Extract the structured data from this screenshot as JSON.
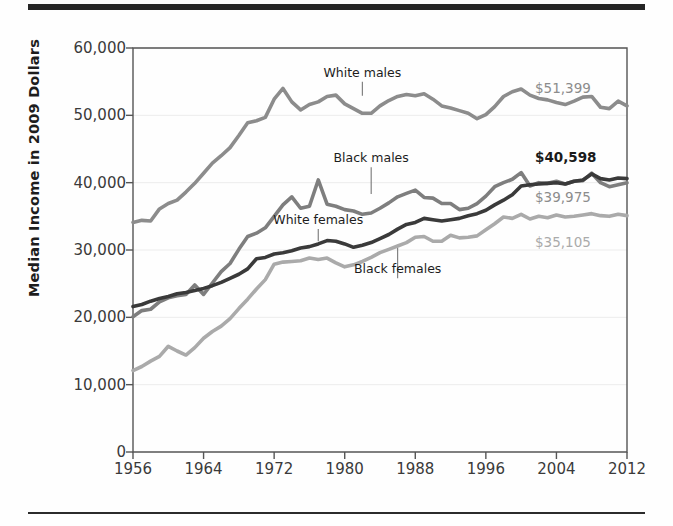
{
  "figure": {
    "rule_top": "horizontal-rule",
    "rule_bottom": "horizontal-rule"
  },
  "chart_data": {
    "type": "line",
    "title": "",
    "xlabel": "",
    "ylabel": "Median Income in 2009 Dollars",
    "xlim": [
      1956,
      2012
    ],
    "ylim": [
      0,
      60000
    ],
    "grid": true,
    "legend_position": "inline-annotations",
    "ytick_labels": [
      "0",
      "10,000",
      "20,000",
      "30,000",
      "40,000",
      "50,000",
      "60,000"
    ],
    "ytick_values": [
      0,
      10000,
      20000,
      30000,
      40000,
      50000,
      60000
    ],
    "xtick_labels": [
      "1956",
      "1964",
      "1972",
      "1980",
      "1988",
      "1996",
      "2004",
      "2012"
    ],
    "xtick_values": [
      1956,
      1964,
      1972,
      1980,
      1988,
      1996,
      2004,
      2012
    ],
    "x": [
      1956,
      1957,
      1958,
      1959,
      1960,
      1961,
      1962,
      1963,
      1964,
      1965,
      1966,
      1967,
      1968,
      1969,
      1970,
      1971,
      1972,
      1973,
      1974,
      1975,
      1976,
      1977,
      1978,
      1979,
      1980,
      1981,
      1982,
      1983,
      1984,
      1985,
      1986,
      1987,
      1988,
      1989,
      1990,
      1991,
      1992,
      1993,
      1994,
      1995,
      1996,
      1997,
      1998,
      1999,
      2000,
      2001,
      2002,
      2003,
      2004,
      2005,
      2006,
      2007,
      2008,
      2009,
      2010,
      2011,
      2012
    ],
    "series": [
      {
        "name": "White males",
        "color": "#8c8c8c",
        "end_value": 51399,
        "end_label": "$51,399",
        "end_label_color": "#8c8c8c",
        "end_label_bold": false,
        "annotation": {
          "text": "White males",
          "x": 1982,
          "y_text": 55600,
          "y_line_end": 52900
        },
        "values": [
          34100,
          34400,
          34300,
          36100,
          36900,
          37400,
          38600,
          39900,
          41400,
          42900,
          44000,
          45200,
          47000,
          48900,
          49200,
          49700,
          52400,
          54000,
          52000,
          50800,
          51600,
          52000,
          52800,
          53000,
          51700,
          51000,
          50300,
          50300,
          51400,
          52200,
          52800,
          53100,
          52900,
          53200,
          52400,
          51400,
          51100,
          50700,
          50300,
          49500,
          50100,
          51300,
          52800,
          53500,
          53900,
          53000,
          52500,
          52300,
          51900,
          51600,
          52100,
          52700,
          52800,
          51200,
          51000,
          52100,
          51399
        ]
      },
      {
        "name": "Black males",
        "color": "#7e7e7e",
        "end_value": 39975,
        "end_label": "$39,975",
        "end_label_color": "#8c8c8c",
        "end_label_bold": false,
        "annotation": {
          "text": "Black males",
          "x": 1983,
          "y_text": 42900,
          "y_line_end": 38300
        },
        "values": [
          20100,
          21000,
          21200,
          22300,
          22900,
          23200,
          23400,
          24800,
          23400,
          25100,
          26800,
          28000,
          30100,
          32000,
          32500,
          33300,
          35000,
          36700,
          37900,
          36200,
          36500,
          40400,
          36800,
          36500,
          36000,
          35800,
          35300,
          35500,
          36200,
          37000,
          37900,
          38400,
          38900,
          37800,
          37700,
          36900,
          36900,
          36000,
          36200,
          36900,
          38000,
          39400,
          40000,
          40500,
          41500,
          39500,
          40000,
          39900,
          40200,
          39800,
          40200,
          40300,
          41400,
          40000,
          39400,
          39700,
          39975
        ]
      },
      {
        "name": "White females",
        "color": "#3a3a3a",
        "end_value": 40598,
        "end_label": "$40,598",
        "end_label_color": "#1a1a1a",
        "end_label_bold": true,
        "annotation": {
          "text": "White females",
          "x": 1977,
          "y_text": 33700,
          "y_line_end": 31300
        },
        "values": [
          21600,
          21900,
          22400,
          22800,
          23100,
          23500,
          23700,
          24000,
          24300,
          24700,
          25200,
          25800,
          26400,
          27200,
          28700,
          28900,
          29400,
          29600,
          29900,
          30300,
          30500,
          30900,
          31400,
          31300,
          30900,
          30400,
          30700,
          31100,
          31700,
          32300,
          33100,
          33800,
          34100,
          34700,
          34500,
          34300,
          34500,
          34700,
          35100,
          35400,
          35900,
          36700,
          37400,
          38200,
          39500,
          39700,
          39800,
          39900,
          40000,
          39800,
          40200,
          40400,
          41300,
          40600,
          40400,
          40700,
          40598
        ]
      },
      {
        "name": "Black females",
        "color": "#aaaaaa",
        "end_value": 35105,
        "end_label": "$35,105",
        "end_label_color": "#aaaaaa",
        "end_label_bold": false,
        "annotation": {
          "text": "Black females",
          "x": 1986,
          "y_text": 26400,
          "y_line_end": 30300
        },
        "values": [
          12100,
          12700,
          13500,
          14200,
          15700,
          15000,
          14400,
          15500,
          16900,
          17900,
          18700,
          19800,
          21300,
          22700,
          24200,
          25600,
          27900,
          28200,
          28300,
          28400,
          28800,
          28600,
          28800,
          28100,
          27500,
          27800,
          28300,
          28900,
          29600,
          30100,
          30600,
          31100,
          31900,
          32000,
          31300,
          31300,
          32200,
          31800,
          31900,
          32100,
          33000,
          33900,
          34900,
          34700,
          35300,
          34600,
          35000,
          34800,
          35200,
          34900,
          35000,
          35200,
          35400,
          35100,
          35000,
          35300,
          35105
        ]
      }
    ]
  }
}
